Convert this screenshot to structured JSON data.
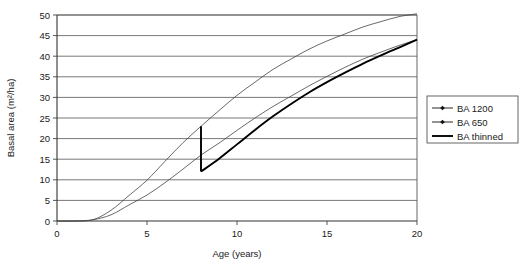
{
  "chart_data": {
    "type": "line",
    "title": "",
    "xlabel": "Age (years)",
    "ylabel": "Basal area (m²/ha)",
    "xlim": [
      0,
      20
    ],
    "ylim": [
      0,
      50
    ],
    "xticks": [
      "0",
      "5",
      "10",
      "15",
      "20"
    ],
    "yticks": [
      "0",
      "5",
      "10",
      "15",
      "20",
      "25",
      "30",
      "35",
      "40",
      "45",
      "50"
    ],
    "grid": "horizontal",
    "legend_position": "right",
    "x": [
      0,
      1,
      2,
      3,
      4,
      5,
      6,
      7,
      8,
      9,
      10,
      11,
      12,
      13,
      14,
      15,
      16,
      17,
      18,
      19,
      20
    ],
    "series": [
      {
        "name": "BA 1200",
        "marker": "diamond",
        "values": [
          0,
          0,
          0.3,
          2.6,
          6.2,
          9.9,
          14.5,
          19.0,
          23.0,
          26.8,
          30.5,
          33.7,
          36.8,
          39.3,
          41.7,
          43.7,
          45.4,
          47.1,
          48.4,
          49.6,
          50.3
        ]
      },
      {
        "name": "BA 650",
        "marker": "diamond",
        "values": [
          0,
          0,
          0.3,
          1.5,
          3.9,
          6.3,
          9.3,
          12.6,
          16.0,
          18.9,
          22.0,
          25.0,
          27.8,
          30.3,
          32.8,
          35.1,
          37.3,
          39.3,
          41.0,
          42.6,
          44.0
        ]
      },
      {
        "name": "BA thinned",
        "marker": "none",
        "thinning_age": 8,
        "thinning_from": 23.0,
        "thinning_to": 12.0,
        "x": [
          8,
          8,
          9,
          10,
          11,
          12,
          13,
          14,
          15,
          16,
          17,
          18,
          19,
          20
        ],
        "values": [
          23.0,
          12.0,
          15.1,
          18.6,
          22.1,
          25.4,
          28.4,
          31.2,
          33.7,
          36.0,
          38.2,
          40.2,
          42.1,
          44.0
        ]
      }
    ]
  },
  "legend": {
    "items": [
      {
        "label": "BA 1200",
        "style": "line-marker"
      },
      {
        "label": "BA 650",
        "style": "line-marker"
      },
      {
        "label": "BA thinned",
        "style": "line-thick"
      }
    ]
  }
}
